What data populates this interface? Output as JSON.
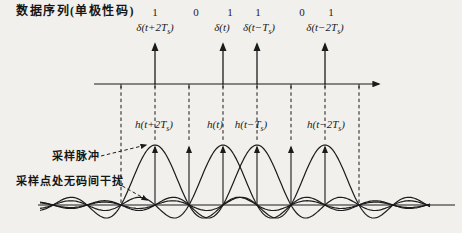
{
  "title": "数据序列(单极性码)",
  "bits": {
    "values": [
      "1",
      "0",
      "1",
      "1",
      "0",
      "1"
    ],
    "xs": [
      155,
      196,
      230,
      258,
      302,
      331
    ]
  },
  "impulses": [
    {
      "base": "δ(t+2T",
      "sub": "s",
      "close": ")",
      "label_x": 155
    },
    {
      "base": "δ(t",
      "sub": "",
      "close": ")",
      "label_x": 222
    },
    {
      "base": "δ(t−T",
      "sub": "s",
      "close": ")",
      "label_x": 259
    },
    {
      "base": "δ(t−2T",
      "sub": "s",
      "close": ")",
      "label_x": 325
    }
  ],
  "pulses": [
    {
      "base": "h(t+2T",
      "sub": "s",
      "close": ")",
      "label_x": 154
    },
    {
      "base": "h(t",
      "sub": "",
      "close": ")",
      "label_x": 215
    },
    {
      "base": "h(t−T",
      "sub": "s",
      "close": ")",
      "label_x": 251
    },
    {
      "base": "h(t−2T",
      "sub": "s",
      "close": ")",
      "label_x": 326
    }
  ],
  "annotations": {
    "sampling_pulse": "采样脉冲",
    "no_isi": "采样点处无码间干扰"
  },
  "colors": {
    "ink": "#1b1b1b",
    "background": "#f2f0ec"
  },
  "layout": {
    "bit_xs": [
      155,
      189,
      223,
      257,
      291,
      325
    ],
    "impulse_xs": [
      155,
      223,
      257,
      325
    ],
    "guide_xs": [
      121,
      359
    ],
    "top_axis": {
      "y": 84,
      "x1": 94,
      "x2": 379
    },
    "baseline": {
      "y": 205,
      "x1": 38,
      "x2": 455
    },
    "pulse": {
      "amplitude": 60,
      "period": 34,
      "curve_x1": 40,
      "curve_x2": 430
    },
    "impulse_arrow_end_y": 44,
    "sampling_arrow_end_y": 147,
    "bit_guide_end_y": 140,
    "leader1": {
      "x1": 101,
      "y1": 156,
      "x2": 146,
      "y2": 145
    },
    "leader2": {
      "x1": 117,
      "y1": 183,
      "x2": 147,
      "y2": 200
    }
  }
}
